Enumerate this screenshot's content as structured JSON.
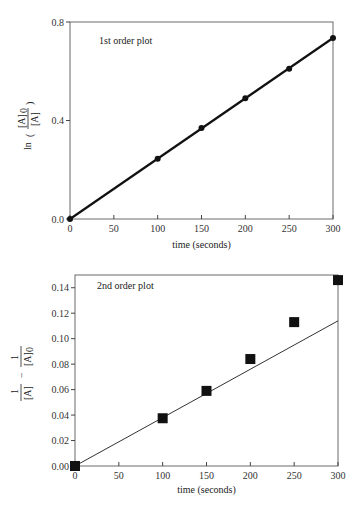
{
  "chart_data": [
    {
      "type": "line",
      "title": "",
      "annotation": "1st order plot",
      "xlabel": "time (seconds)",
      "ylabel": "ln([A]0/[A])",
      "ylabel_parts": {
        "func": "ln",
        "numerator": "[A]",
        "numerator_sub": "0",
        "denominator": "[A]"
      },
      "xlim": [
        0,
        300
      ],
      "ylim": [
        0,
        0.8
      ],
      "xticks": [
        0,
        50,
        100,
        150,
        200,
        250,
        300
      ],
      "yticks": [
        0.0,
        0.4,
        0.8
      ],
      "ytick_labels": [
        "0.0",
        "0.4",
        "0.8"
      ],
      "grid": false,
      "legend": "none",
      "series": [
        {
          "name": "data",
          "marker": "circle",
          "x": [
            0,
            100,
            150,
            200,
            250,
            300
          ],
          "y": [
            0.0,
            0.245,
            0.37,
            0.49,
            0.61,
            0.735
          ]
        },
        {
          "name": "fit",
          "style": "line",
          "x": [
            0,
            300
          ],
          "y": [
            0.0,
            0.735
          ]
        }
      ],
      "layout": {
        "left": 70,
        "top": 22,
        "right": 333,
        "bottom": 219
      }
    },
    {
      "type": "scatter",
      "title": "",
      "annotation": "2nd order plot",
      "xlabel": "time (seconds)",
      "ylabel": "1/[A] - 1/[A]0",
      "ylabel_parts": {
        "a_num": "1",
        "a_den": "[A]",
        "op": "−",
        "b_num": "1",
        "b_den": "[A]",
        "b_sub": "0"
      },
      "xlim": [
        0,
        300
      ],
      "ylim": [
        0,
        0.15
      ],
      "xticks": [
        0,
        50,
        100,
        150,
        200,
        250,
        300
      ],
      "yticks": [
        0.0,
        0.02,
        0.04,
        0.06,
        0.08,
        0.1,
        0.12,
        0.14
      ],
      "ytick_labels": [
        "0.00",
        "0.02",
        "0.04",
        "0.06",
        "0.08",
        "0.10",
        "0.12",
        "0.14"
      ],
      "grid": false,
      "legend": "none",
      "series": [
        {
          "name": "data",
          "marker": "square",
          "x": [
            0,
            100,
            150,
            200,
            250,
            300
          ],
          "y": [
            0.0,
            0.0375,
            0.059,
            0.084,
            0.113,
            0.146
          ]
        },
        {
          "name": "fit",
          "style": "line",
          "x": [
            0,
            300
          ],
          "y": [
            0.0,
            0.114
          ]
        }
      ],
      "layout": {
        "left": 75,
        "top": 275,
        "right": 338,
        "bottom": 466
      }
    }
  ]
}
